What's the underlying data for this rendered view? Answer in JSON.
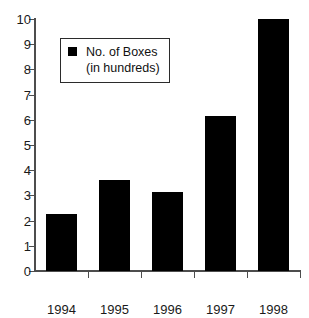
{
  "chart_data": {
    "type": "bar",
    "title": "",
    "subtitle": "",
    "xlabel": "",
    "ylabel": "",
    "categories": [
      "1994",
      "1995",
      "1996",
      "1997",
      "1998"
    ],
    "values": [
      2.25,
      3.6,
      3.15,
      6.15,
      10.0
    ],
    "series": [
      {
        "name": "No. of Boxes (in hundreds)",
        "values": [
          2.25,
          3.6,
          3.15,
          6.15,
          10.0
        ],
        "color": "#000000"
      }
    ],
    "ylim": [
      0,
      10
    ],
    "xlim_categories": 5,
    "y_ticks": [
      "0",
      "1",
      "2",
      "3",
      "4",
      "5",
      "6",
      "7",
      "8",
      "9",
      "10"
    ],
    "y_tick_values": [
      0,
      1,
      2,
      3,
      4,
      5,
      6,
      7,
      8,
      9,
      10
    ],
    "grid": false,
    "legend_position": "upper-left",
    "bar_color": "#000000",
    "axis_color": "#4d4d4d",
    "background": "#ffffff"
  },
  "legend": {
    "marker": "filled-square",
    "line1": "No. of Boxes",
    "line2": "(in hundreds)"
  }
}
